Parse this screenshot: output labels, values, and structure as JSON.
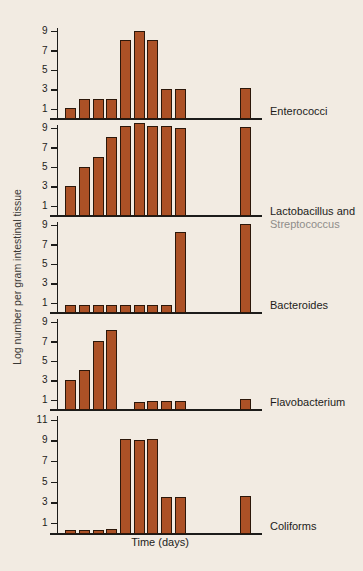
{
  "figure": {
    "xlabel": "Time (days)",
    "ylabel": "Log number per gram intestinal tissue"
  },
  "colors": {
    "background": "#f2ebe2",
    "bar_fill": "#ac5126",
    "bar_outline": "#2c170a",
    "axis": "#1d1c1a",
    "label_secondary": "#8f8d8a"
  },
  "chart_data": {
    "type": "bar",
    "title": "",
    "xlabel": "Time (days)",
    "ylabel": "Log number per gram intestinal tissue",
    "x_range": [
      0,
      15
    ],
    "x_tick_labels_shown": false,
    "x_positions": [
      1,
      2,
      3,
      4,
      5,
      6,
      7,
      8,
      9,
      13.8
    ],
    "panels": [
      {
        "label": "Enterococci",
        "label_line2": "",
        "ymax": 10,
        "yticks": [
          1,
          3,
          5,
          7,
          9
        ],
        "values": [
          1,
          2,
          2,
          2,
          8,
          9,
          8,
          3,
          3,
          3.1
        ]
      },
      {
        "label": "Lactobacillus and",
        "label_line2": "Streptococcus",
        "ymax": 10,
        "yticks": [
          1,
          3,
          5,
          7,
          9
        ],
        "values": [
          3,
          5,
          6,
          8,
          9.2,
          9.5,
          9.2,
          9.2,
          9,
          9.1
        ]
      },
      {
        "label": "Bacteroides",
        "label_line2": "",
        "ymax": 10,
        "yticks": [
          1,
          3,
          5,
          7,
          9
        ],
        "values": [
          0.7,
          0.7,
          0.7,
          0.7,
          0.7,
          0.7,
          0.7,
          0.7,
          8.2,
          9.1
        ]
      },
      {
        "label": "Flavobacterium",
        "label_line2": "",
        "ymax": 10,
        "yticks": [
          1,
          3,
          5,
          7,
          9
        ],
        "values": [
          3,
          4,
          7,
          8.1,
          null,
          0.7,
          0.8,
          0.8,
          0.8,
          1
        ]
      },
      {
        "label": "Coliforms",
        "label_line2": "",
        "ymax": 12,
        "yticks": [
          1,
          3,
          5,
          7,
          9,
          11
        ],
        "values": [
          0.3,
          0.3,
          0.3,
          0.4,
          9.1,
          9,
          9.1,
          3.5,
          3.5,
          3.6
        ]
      }
    ]
  }
}
